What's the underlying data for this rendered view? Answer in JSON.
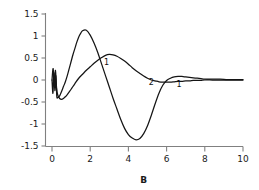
{
  "chart_data": {
    "type": "line",
    "title": "",
    "xlabel": "B",
    "ylabel": "",
    "xlim": [
      0,
      10
    ],
    "ylim": [
      -1.5,
      1.5
    ],
    "grid": false,
    "legend": "none",
    "xticks": [
      "0",
      "2",
      "4",
      "6",
      "8",
      "10"
    ],
    "xtick_values": [
      0,
      2,
      4,
      6,
      8,
      10
    ],
    "yticks": [
      "1.5",
      "1",
      "0.5",
      "0",
      "-0.5",
      "-1",
      "-1.5"
    ],
    "ytick_values": [
      1.5,
      1,
      0.5,
      0,
      -0.5,
      -1,
      -1.5
    ],
    "annotations": [
      {
        "text": "1",
        "x": 2.85,
        "y": 0.42
      },
      {
        "text": "2",
        "x": 5.2,
        "y": -0.04
      },
      {
        "text": "1",
        "x": 6.65,
        "y": -0.09
      }
    ],
    "series": [
      {
        "name": "1",
        "color": "#151515",
        "x": [
          0.0,
          0.05,
          0.1,
          0.15,
          0.2,
          0.25,
          0.3,
          0.4,
          0.5,
          0.6,
          0.7,
          0.8,
          0.9,
          1.0,
          1.1,
          1.2,
          1.3,
          1.4,
          1.5,
          1.6,
          1.8,
          2.0,
          2.2,
          2.4,
          2.6,
          2.8,
          3.0,
          3.2,
          3.4,
          3.6,
          3.8,
          4.0,
          4.2,
          4.4,
          4.6,
          4.8,
          5.0,
          5.2,
          5.4,
          5.6,
          5.8,
          6.0,
          6.2,
          6.4,
          6.6,
          6.8,
          7.0,
          7.2,
          7.4,
          7.6,
          7.8,
          8.0,
          8.4,
          8.8,
          9.2,
          9.6,
          10.0
        ],
        "y": [
          0.0,
          -0.3,
          0.16,
          -0.24,
          0.1,
          -0.36,
          -0.4,
          -0.36,
          -0.26,
          -0.15,
          -0.04,
          0.1,
          0.26,
          0.42,
          0.58,
          0.72,
          0.86,
          0.98,
          1.06,
          1.12,
          1.13,
          1.02,
          0.84,
          0.62,
          0.36,
          0.1,
          -0.16,
          -0.42,
          -0.66,
          -0.9,
          -1.1,
          -1.24,
          -1.32,
          -1.36,
          -1.33,
          -1.22,
          -1.04,
          -0.8,
          -0.54,
          -0.3,
          -0.12,
          -0.01,
          0.04,
          0.07,
          0.08,
          0.08,
          0.07,
          0.06,
          0.05,
          0.04,
          0.03,
          0.02,
          0.02,
          0.02,
          0.01,
          0.01,
          0.01
        ]
      },
      {
        "name": "2",
        "color": "#151515",
        "x": [
          0.0,
          0.06,
          0.12,
          0.18,
          0.24,
          0.3,
          0.4,
          0.5,
          0.6,
          0.7,
          0.8,
          0.9,
          1.0,
          1.2,
          1.4,
          1.6,
          1.8,
          2.0,
          2.2,
          2.4,
          2.6,
          2.8,
          3.0,
          3.2,
          3.4,
          3.6,
          3.8,
          4.0,
          4.2,
          4.4,
          4.6,
          4.8,
          5.0,
          5.2,
          5.4,
          5.6,
          5.8,
          6.0,
          6.2,
          6.4,
          6.6,
          6.8,
          7.0,
          7.2,
          7.4,
          7.6,
          7.8,
          8.0,
          8.4,
          8.8,
          9.2,
          9.6,
          10.0
        ],
        "y": [
          0.0,
          0.26,
          -0.1,
          0.22,
          -0.18,
          -0.34,
          -0.42,
          -0.44,
          -0.42,
          -0.38,
          -0.33,
          -0.27,
          -0.21,
          -0.08,
          0.04,
          0.13,
          0.22,
          0.3,
          0.38,
          0.45,
          0.51,
          0.56,
          0.58,
          0.57,
          0.54,
          0.49,
          0.43,
          0.36,
          0.28,
          0.21,
          0.15,
          0.09,
          0.04,
          0.0,
          -0.02,
          -0.04,
          -0.05,
          -0.05,
          -0.05,
          -0.04,
          -0.03,
          -0.03,
          -0.02,
          -0.02,
          -0.01,
          -0.01,
          -0.01,
          0.0,
          0.0,
          0.0,
          0.0,
          0.0,
          0.0
        ]
      }
    ]
  },
  "colors": {
    "curve": "#151515",
    "axis": "#808080",
    "text": "#1a1a1a",
    "background": "#ffffff"
  }
}
